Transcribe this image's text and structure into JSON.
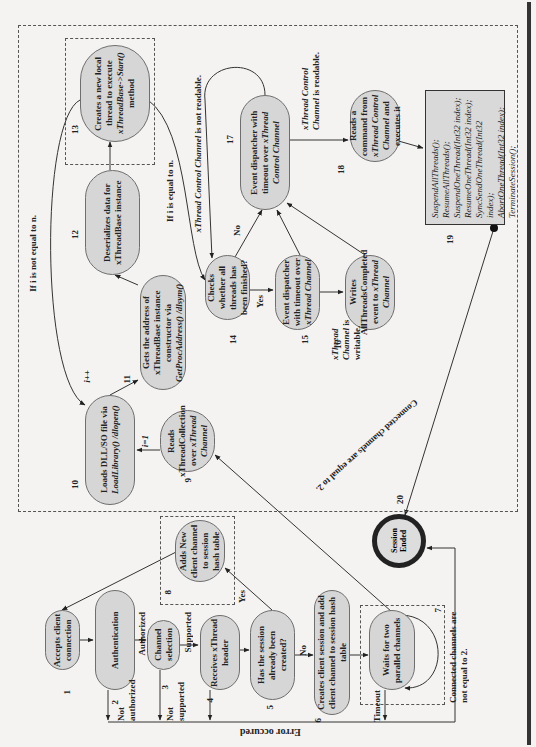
{
  "diagram": {
    "orientation": "rotated 90 degrees counter-clockwise",
    "nodes": [
      {
        "id": "1",
        "label": "Accepts client connection"
      },
      {
        "id": "2",
        "label": "Authentication"
      },
      {
        "id": "3",
        "label": "Channel selection"
      },
      {
        "id": "4",
        "label": "Receives xThread header"
      },
      {
        "id": "5",
        "label": "Has the session already been created?"
      },
      {
        "id": "6",
        "label": "Creates client session and add client channel to session hash table"
      },
      {
        "id": "7",
        "label": "Waits for two parallel channels"
      },
      {
        "id": "8",
        "label": "Adds New client channel to session hash table"
      },
      {
        "id": "9",
        "label_pre": "Reads xThreadCollection over ",
        "label_it": "xThread Channel"
      },
      {
        "id": "10",
        "label_pre": "Loads DLL/SO file via ",
        "label_it": "LoadLibrary() /dlopen()"
      },
      {
        "id": "11",
        "label_pre": "Gets the address of xThreadBase instance constructor via ",
        "label_it": "GetProcAddress() /dlsym()"
      },
      {
        "id": "12",
        "label": "Deserializes data for xThreadBase instance"
      },
      {
        "id": "13",
        "label_pre": "Creates a new local thread to execute ",
        "label_it": "xThreadBase->Start()",
        "label_post": " method"
      },
      {
        "id": "14",
        "label": "Checks whether all threads has been finished?"
      },
      {
        "id": "15",
        "label_pre": "Event dispatcher with timeout over ",
        "label_it": "xThread Channel"
      },
      {
        "id": "16",
        "label_pre": "Writes AllThreadsCompleted event to ",
        "label_it": "xThread Channel"
      },
      {
        "id": "17",
        "label_pre": "Event dispatcher with timeout over ",
        "label_it": "xThread Control Channel"
      },
      {
        "id": "18",
        "label_pre": "Reads a command from ",
        "label_it": "xThread Control Channel",
        "label_post": " and executes it"
      },
      {
        "id": "19",
        "commands": [
          "SuspendAllThreads();",
          "ResumeAllThreads();",
          "SuspendOneThread(Int32 index);",
          "ResumeOneThread(Int32 index);",
          "SyncSendOneThread(Int32 index);",
          "AbortOneThread(Int32 index);",
          "TerminateSession();"
        ]
      },
      {
        "id": "20",
        "label": "Session Ended"
      }
    ],
    "edge_labels": {
      "authorized": "Authorized",
      "not_authorized": "Not authorized",
      "supported": "Supported",
      "not_supported": "Not supported",
      "yes_5": "Yes",
      "no_5": "No",
      "timeout": "Timeout",
      "connected_not_2": "Connected channels are not equal to 2.",
      "connected_eq_2": "Connected channels are equal to 2.",
      "error": "Error occured",
      "i_eq_1": "i=1",
      "i_inc": "i++",
      "i_not_n": "If i is not equal to  n.",
      "i_eq_n": "If i is equal to  n.",
      "yes_14": "Yes",
      "no_14": "No",
      "ctrl_not_readable_it": "xThread Control Channel",
      "ctrl_not_readable": "  is not readable.",
      "ctrl_readable_it": "xThread Control Channel",
      "ctrl_readable": " is readable.",
      "chan_writable_it": "xThread Channel",
      "chan_writable": "is writable."
    }
  }
}
